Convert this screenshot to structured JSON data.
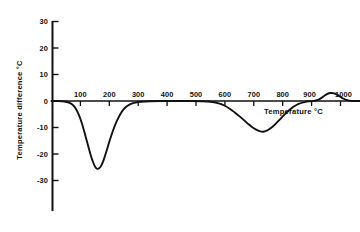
{
  "chart_data": {
    "type": "line",
    "title": "",
    "xlabel": "Temperature °C",
    "ylabel": "Temperature difference °C",
    "xlim": [
      0,
      1070
    ],
    "ylim": [
      -38,
      33
    ],
    "grid": false,
    "legend": "none",
    "xticks": [
      100,
      200,
      300,
      400,
      500,
      600,
      700,
      800,
      900,
      1000
    ],
    "xtick_labels": [
      "100",
      "200",
      "300",
      "400",
      "500",
      "600",
      "700",
      "800",
      "900",
      "1000"
    ],
    "yticks": [
      30,
      20,
      10,
      0,
      -10,
      -20,
      -30
    ],
    "ytick_labels": [
      "30",
      "20",
      "10",
      "0",
      "-10",
      "-20",
      "-30"
    ],
    "series": [
      {
        "name": "DTA curve",
        "color": "#111111",
        "x": [
          0,
          20,
          45,
          65,
          80,
          92,
          104,
          115,
          126,
          136,
          145,
          152,
          158,
          165,
          172,
          180,
          190,
          200,
          212,
          225,
          238,
          250,
          262,
          275,
          290,
          310,
          340,
          380,
          430,
          480,
          520,
          550,
          575,
          598,
          618,
          635,
          652,
          668,
          682,
          696,
          708,
          720,
          732,
          745,
          758,
          772,
          788,
          802,
          818,
          836,
          855,
          875,
          893,
          908,
          922,
          936,
          950,
          964,
          978,
          992,
          1005,
          1020,
          1040,
          1070
        ],
        "y": [
          0,
          0,
          -0.2,
          -0.8,
          -2.2,
          -4.6,
          -8.0,
          -12.2,
          -16.6,
          -20.6,
          -23.4,
          -25.0,
          -25.6,
          -25.4,
          -24.4,
          -22.4,
          -19.0,
          -15.4,
          -11.4,
          -7.8,
          -5.0,
          -3.1,
          -1.9,
          -1.1,
          -0.6,
          -0.3,
          -0.1,
          0,
          0,
          0,
          -0.1,
          -0.3,
          -0.8,
          -1.7,
          -3.0,
          -4.4,
          -5.9,
          -7.4,
          -8.8,
          -10.0,
          -10.8,
          -11.4,
          -11.6,
          -11.2,
          -10.3,
          -9.0,
          -7.2,
          -5.6,
          -3.9,
          -2.3,
          -1.1,
          -0.4,
          -0.1,
          0,
          0.4,
          1.3,
          2.4,
          3.0,
          2.9,
          2.1,
          1.2,
          0.4,
          0,
          0
        ],
        "peaks": [
          {
            "type": "endothermic",
            "temperature": 158,
            "value": -25.6
          },
          {
            "type": "endothermic",
            "temperature": 732,
            "value": -11.6
          },
          {
            "type": "exothermic",
            "temperature": 964,
            "value": 3.0
          }
        ]
      }
    ]
  },
  "axes": {
    "x_axis_name": "temperature-axis",
    "y_axis_name": "temperature-difference-axis"
  }
}
